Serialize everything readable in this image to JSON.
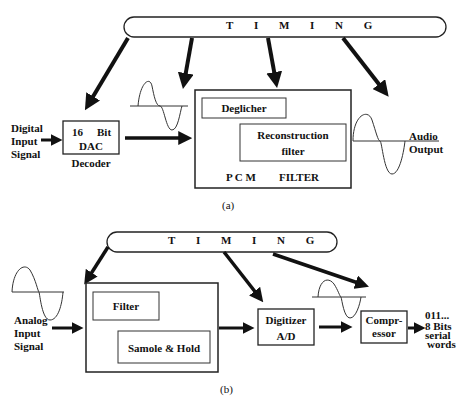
{
  "figure_a": {
    "caption": "(a)",
    "timing_label": "T I M I N G",
    "input_label": [
      "Digital",
      "Input",
      "Signal"
    ],
    "dac_block": {
      "line1_left": "16",
      "line1_right": "Bit",
      "line2": "DAC",
      "below": "Decoder"
    },
    "pcm_filter_block": {
      "deglicher": "Deglicher",
      "reconstruction": [
        "Reconstruction",
        "filter"
      ],
      "bottom_left": "P C M",
      "bottom_right": "FILTER"
    },
    "output_label": [
      "Audio",
      "Output"
    ]
  },
  "figure_b": {
    "caption": "(b)",
    "timing_label": "T I M I N G",
    "input_label": [
      "Analog",
      "Input",
      "Signal"
    ],
    "filter_block": {
      "filter": "Filter",
      "sample_hold": "Samole & Hold"
    },
    "digitizer_block": {
      "line1": "Digitizer",
      "line2": "A/D"
    },
    "compressor_block": {
      "line1": "Compr-",
      "line2": "essor"
    },
    "output_label": [
      "011...",
      "8 Bits",
      "serial",
      "words"
    ]
  }
}
